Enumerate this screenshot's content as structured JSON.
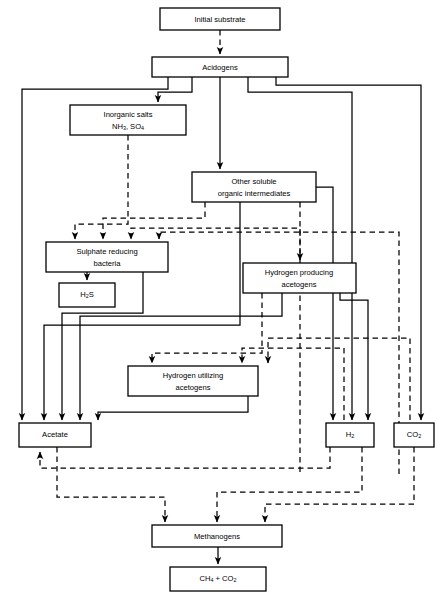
{
  "diagram": {
    "line_styles": {
      "solid": "solid-connector",
      "dashed": "dashed-connector"
    },
    "colors": {
      "stroke": "#000000",
      "box_fill": "#ffffff",
      "background": "#ffffff"
    },
    "nodes": [
      {
        "id": "initial-substrate",
        "label": "Initial substrate",
        "lines": [
          "Initial substrate"
        ],
        "x": 160,
        "y": 8,
        "w": 120,
        "h": 22
      },
      {
        "id": "acidogens",
        "label": "Acidogens",
        "lines": [
          "Acidogens"
        ],
        "x": 152,
        "y": 57,
        "w": 136,
        "h": 20
      },
      {
        "id": "inorganic-salts",
        "label": "Inorganic salts NH3, SO4",
        "lines": [
          "Inorganic salts",
          "NH3, SO4"
        ],
        "x": 70,
        "y": 105,
        "w": 116,
        "h": 30
      },
      {
        "id": "other-soluble-organic-intermediates",
        "label": "Other soluble organic intermediates",
        "lines": [
          "Other soluble",
          "organic intermediates"
        ],
        "x": 192,
        "y": 172,
        "w": 124,
        "h": 30
      },
      {
        "id": "sulphate-reducing-bacteria",
        "label": "Sulphate reducing bacteria",
        "lines": [
          "Sulphate reducing",
          "bacteria"
        ],
        "x": 46,
        "y": 242,
        "w": 122,
        "h": 30
      },
      {
        "id": "hydrogen-producing-acetogens",
        "label": "Hydrogen producing acetogens",
        "lines": [
          "Hydrogen producing",
          "acetogens"
        ],
        "x": 243,
        "y": 263,
        "w": 113,
        "h": 30
      },
      {
        "id": "h2s",
        "label": "H2S",
        "lines": [
          "H2S"
        ],
        "x": 59,
        "y": 283,
        "w": 56,
        "h": 24
      },
      {
        "id": "hydrogen-utilizing-acetogens",
        "label": "Hydrogen utilizing acetogens",
        "lines": [
          "Hydrogen utilizing",
          "acetogens"
        ],
        "x": 128,
        "y": 366,
        "w": 130,
        "h": 30
      },
      {
        "id": "acetate",
        "label": "Acetate",
        "lines": [
          "Acetate"
        ],
        "x": 19,
        "y": 423,
        "w": 72,
        "h": 24
      },
      {
        "id": "h2",
        "label": "H2",
        "lines": [
          "H2"
        ],
        "x": 326,
        "y": 423,
        "w": 48,
        "h": 24
      },
      {
        "id": "co2",
        "label": "CO2",
        "lines": [
          "CO2"
        ],
        "x": 394,
        "y": 423,
        "w": 40,
        "h": 24
      },
      {
        "id": "methanogens",
        "label": "Methanogens",
        "lines": [
          "Methanogens"
        ],
        "x": 152,
        "y": 525,
        "w": 130,
        "h": 22
      },
      {
        "id": "final-products",
        "label": "CH4 + CO2",
        "lines": [
          "CH4 + CO2"
        ],
        "x": 170,
        "y": 567,
        "w": 96,
        "h": 24
      }
    ],
    "node_text": {
      "initial_substrate": "Initial substrate",
      "acidogens": "Acidogens",
      "inorganic_salts_l1": "Inorganic salts",
      "inorganic_salts_nh": "NH",
      "inorganic_salts_nh_sub": "3",
      "inorganic_salts_so": ", SO",
      "inorganic_salts_so_sub": "4",
      "other_soluble_l1": "Other soluble",
      "other_soluble_l2": "organic intermediates",
      "sulphate_l1": "Sulphate reducing",
      "sulphate_l2": "bacteria",
      "h2s_main": "H",
      "h2s_sub": "2",
      "h2s_tail": "S",
      "hyd_prod_l1": "Hydrogen producing",
      "hyd_prod_l2": "acetogens",
      "hyd_util_l1": "Hydrogen utilizing",
      "hyd_util_l2": "acetogens",
      "acetate": "Acetate",
      "h2_main": "H",
      "h2_sub": "2",
      "co2_main": "CO",
      "co2_sub": "2",
      "methanogens": "Methanogens",
      "final_ch": "CH",
      "final_ch_sub": "4",
      "final_plus": " + CO",
      "final_co_sub": "2"
    },
    "edges": [
      {
        "id": "initial-to-acidogens",
        "style": "dashed",
        "from": "initial-substrate",
        "to": "acidogens"
      },
      {
        "id": "acidogens-to-inorganic-salts",
        "style": "solid",
        "from": "acidogens",
        "to": "inorganic-salts"
      },
      {
        "id": "acidogens-to-other-soluble",
        "style": "solid",
        "from": "acidogens",
        "to": "other-soluble-organic-intermediates"
      },
      {
        "id": "acidogens-to-sulphate-left",
        "style": "solid",
        "from": "acidogens",
        "to": "sulphate-reducing-bacteria"
      },
      {
        "id": "acidogens-to-h2",
        "style": "solid",
        "from": "acidogens",
        "to": "h2"
      },
      {
        "id": "acidogens-to-co2",
        "style": "solid",
        "from": "acidogens",
        "to": "co2"
      },
      {
        "id": "inorganic-to-sulphate",
        "style": "dashed",
        "from": "inorganic-salts",
        "to": "sulphate-reducing-bacteria"
      },
      {
        "id": "other-soluble-to-sulphate",
        "style": "dashed",
        "from": "other-soluble-organic-intermediates",
        "to": "sulphate-reducing-bacteria"
      },
      {
        "id": "other-soluble-to-hydrogen-producing",
        "style": "dashed",
        "from": "other-soluble-organic-intermediates",
        "to": "hydrogen-producing-acetogens"
      },
      {
        "id": "other-soluble-to-acetate",
        "style": "solid",
        "from": "other-soluble-organic-intermediates",
        "to": "acetate"
      },
      {
        "id": "other-soluble-to-h2",
        "style": "solid",
        "from": "other-soluble-organic-intermediates",
        "to": "h2"
      },
      {
        "id": "sulphate-to-h2s",
        "style": "solid",
        "from": "sulphate-reducing-bacteria",
        "to": "h2s"
      },
      {
        "id": "sulphate-to-acetate",
        "style": "solid",
        "from": "sulphate-reducing-bacteria",
        "to": "acetate"
      },
      {
        "id": "hydrogen-producing-to-hydrogen-utilizing",
        "style": "dashed",
        "from": "hydrogen-producing-acetogens",
        "to": "hydrogen-utilizing-acetogens"
      },
      {
        "id": "hydrogen-producing-to-acetate",
        "style": "solid",
        "from": "hydrogen-producing-acetogens",
        "to": "acetate"
      },
      {
        "id": "hydrogen-producing-to-h2",
        "style": "solid",
        "from": "hydrogen-producing-acetogens",
        "to": "h2"
      },
      {
        "id": "hydrogen-utilizing-to-acetate",
        "style": "solid",
        "from": "hydrogen-utilizing-acetogens",
        "to": "acetate"
      },
      {
        "id": "h2-to-hydrogen-utilizing",
        "style": "dashed",
        "from": "h2",
        "to": "hydrogen-utilizing-acetogens"
      },
      {
        "id": "co2-to-hydrogen-utilizing",
        "style": "dashed",
        "from": "co2",
        "to": "hydrogen-utilizing-acetogens"
      },
      {
        "id": "h2-to-acetate-feedback",
        "style": "dashed",
        "from": "h2",
        "to": "acetate"
      },
      {
        "id": "h2-to-sulphate-feedback",
        "style": "dashed",
        "from": "h2",
        "to": "sulphate-reducing-bacteria"
      },
      {
        "id": "co2-to-sulphate-feedback",
        "style": "dashed",
        "from": "co2",
        "to": "sulphate-reducing-bacteria"
      },
      {
        "id": "acetate-to-methanogens",
        "style": "dashed",
        "from": "acetate",
        "to": "methanogens"
      },
      {
        "id": "h2-to-methanogens",
        "style": "dashed",
        "from": "h2",
        "to": "methanogens"
      },
      {
        "id": "co2-to-methanogens",
        "style": "dashed",
        "from": "co2",
        "to": "methanogens"
      },
      {
        "id": "methanogens-to-final",
        "style": "solid",
        "from": "methanogens",
        "to": "final-products"
      }
    ]
  }
}
